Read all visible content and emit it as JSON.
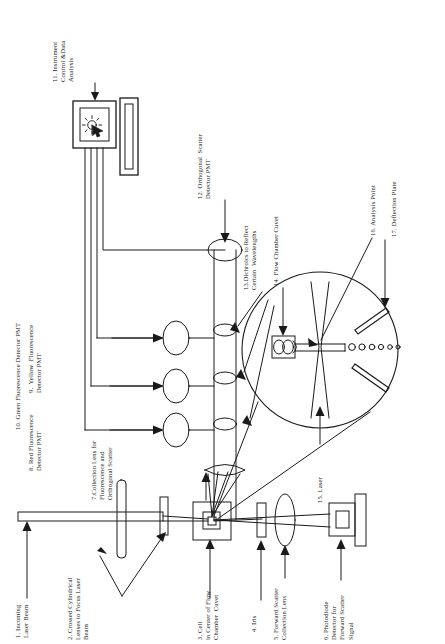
{
  "figure": {
    "type": "schematic-diagram",
    "orientation": "text rotated 90 degrees counter-clockwise"
  },
  "labels": [
    {
      "id": "1",
      "number": "1.",
      "text": "1. Incoming\nLaser Beam"
    },
    {
      "id": "2",
      "number": "2.",
      "text": "2. Crossed Cylindrical\nLenses to Focus Laser\nBeam"
    },
    {
      "id": "3",
      "number": "3.",
      "text": "3. Cell\nin Center of Flow\nChamber  Cuvet"
    },
    {
      "id": "4",
      "number": "4.",
      "text": "4. Iris"
    },
    {
      "id": "5",
      "number": "5.",
      "text": "5. Forward Scatter\nCollection Lens"
    },
    {
      "id": "6",
      "number": "6.",
      "text": "6. Photodiode\nDetector for\nForward Scatter\nSignal"
    },
    {
      "id": "7",
      "number": "7.",
      "text": "7.Collection Lens for\nFluorescence and\nOrthogonal Scatter"
    },
    {
      "id": "8",
      "number": "8.",
      "text": "8. Red Fluorescence\nDetector PMT"
    },
    {
      "id": "9",
      "number": "9.",
      "text": "9.  Yellow  Fluorescence\nDetector PMT"
    },
    {
      "id": "10",
      "number": "10.",
      "text": "10. Green Fluorescence Detector PMT"
    },
    {
      "id": "11",
      "number": "11.",
      "text": "11. Instrument\nControl &Data\nAnalysis"
    },
    {
      "id": "12",
      "number": "12.",
      "text": "12. Orthogonal  Scatter\nDetector PMT"
    },
    {
      "id": "13",
      "number": "13.",
      "text": "13.Dichroics to Reflect\nCertain  Wavelengths"
    },
    {
      "id": "14",
      "number": "14.",
      "text": "14. Flow Chamber Cuvet"
    },
    {
      "id": "15",
      "number": "15.",
      "text": "15. Laser"
    },
    {
      "id": "16",
      "number": "16.",
      "text": "16. Analysis Point"
    },
    {
      "id": "17",
      "number": "17.",
      "text": "17. Deflection Plate"
    }
  ],
  "components": {
    "monitor": "computer-monitor",
    "keyboard": "keyboard",
    "pmt_count": 3,
    "dichroic_count": 3,
    "droplet_count": 7,
    "deflection_plate_count": 2
  },
  "colors": {
    "ink": "#111111",
    "paper": "#ffffff",
    "line": "#1a1a1a"
  }
}
